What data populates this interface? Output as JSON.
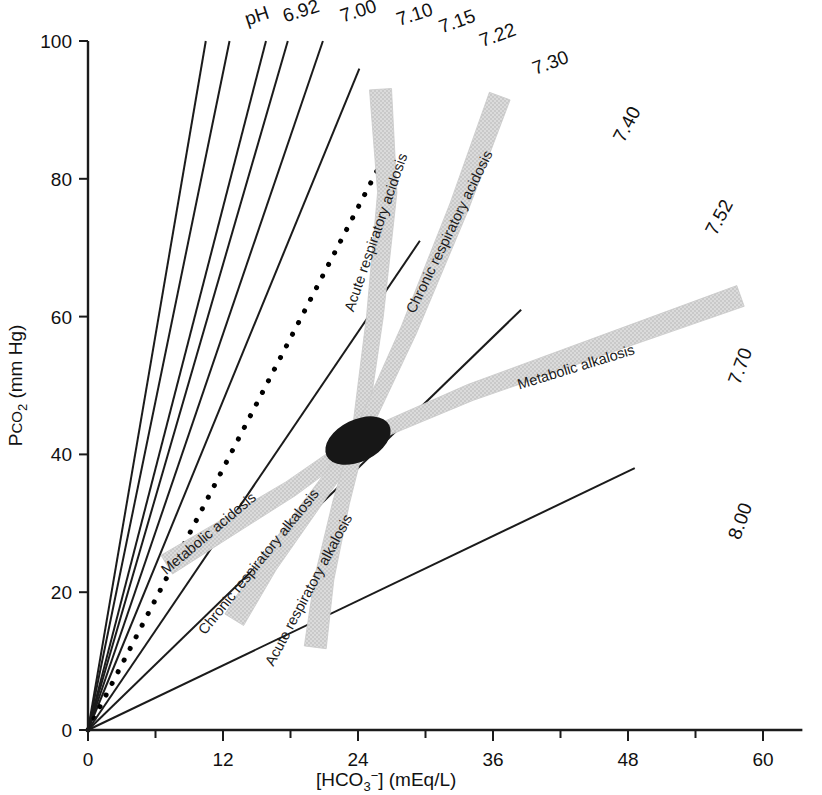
{
  "figure": {
    "background_color": "#ffffff",
    "ink_color": "#1b1b1b",
    "band_color": "#d7d7d7",
    "normal_point_color": "#171717"
  },
  "axes": {
    "x": {
      "label": "[HCO3−] (mEq/L)",
      "label_parts": {
        "prefix": "[HCO",
        "sub": "3",
        "sup": "−",
        "suffix": "] (mEq/L)"
      },
      "ticks": [
        "0",
        "12",
        "24",
        "36",
        "48",
        "60"
      ],
      "tick_values": [
        0,
        12,
        24,
        36,
        48,
        60
      ],
      "minor_tick_values": [
        6,
        18,
        30,
        42,
        54
      ],
      "range": [
        0,
        63
      ]
    },
    "y": {
      "label": "Pco2 (mm Hg)",
      "label_parts": {
        "prefix": "P",
        "small": "CO",
        "sub": "2",
        "suffix": " (mm Hg)"
      },
      "ticks": [
        "0",
        "20",
        "40",
        "60",
        "80",
        "100"
      ],
      "tick_values": [
        0,
        20,
        40,
        60,
        80,
        100
      ],
      "range": [
        0,
        100
      ]
    }
  },
  "ph_axis_prefix": "pH",
  "chart_data": {
    "type": "line",
    "xlabel": "[HCO3-] (mEq/L)",
    "ylabel": "PCO2 (mm Hg)",
    "xlim": [
      0,
      63
    ],
    "ylim": [
      0,
      100
    ],
    "grid": false,
    "legend": "none",
    "note": "Iso-pH rays through the origin; slope = PCO2/[HCO3-]. Shaded bands are 95% confidence regions for single acid-base disturbances.",
    "ph_lines": [
      {
        "label": "6.92",
        "slope": 9.55,
        "style": "solid",
        "end_hco3": 10.47,
        "end_pco2": 100,
        "label_x": 19.1,
        "label_y": 103.5
      },
      {
        "label": "7.00",
        "slope": 7.95,
        "style": "solid",
        "end_hco3": 12.58,
        "end_pco2": 100,
        "label_x": 24.2,
        "label_y": 103.5
      },
      {
        "label": "7.10",
        "slope": 6.32,
        "style": "solid",
        "end_hco3": 15.82,
        "end_pco2": 100,
        "label_x": 29.2,
        "label_y": 103.0
      },
      {
        "label": "7.15",
        "slope": 5.63,
        "style": "solid",
        "end_hco3": 17.76,
        "end_pco2": 100,
        "label_x": 33.0,
        "label_y": 102.0
      },
      {
        "label": "7.22",
        "slope": 4.79,
        "style": "solid",
        "end_hco3": 20.88,
        "end_pco2": 100,
        "label_x": 36.6,
        "label_y": 100.0
      },
      {
        "label": "7.30",
        "slope": 3.98,
        "style": "solid",
        "end_hco3": 24.12,
        "end_pco2": 96,
        "label_x": 41.3,
        "label_y": 96.0
      },
      {
        "label": "7.40",
        "slope": 3.16,
        "style": "dotted",
        "end_hco3": 26.9,
        "end_pco2": 85,
        "label_x": 48.4,
        "label_y": 87.5
      },
      {
        "label": "7.52",
        "slope": 2.4,
        "style": "solid",
        "end_hco3": 29.5,
        "end_pco2": 71,
        "label_x": 56.6,
        "label_y": 74.0
      },
      {
        "label": "7.70",
        "slope": 1.58,
        "style": "solid",
        "end_hco3": 38.5,
        "end_pco2": 61,
        "label_x": 58.5,
        "label_y": 52.5
      },
      {
        "label": "8.00",
        "slope": 0.79,
        "style": "solid",
        "end_hco3": 48.6,
        "end_pco2": 38,
        "label_x": 58.5,
        "label_y": 30.0
      }
    ],
    "bands": [
      {
        "name": "Acute respiratory acidosis",
        "label": "Acute respiratory acidosis",
        "label_hco3": 26.0,
        "label_pco2": 72.0,
        "label_rotation": -71,
        "centerline": [
          [
            24,
            42
          ],
          [
            25.5,
            60
          ],
          [
            26.6,
            78
          ],
          [
            26.0,
            93
          ]
        ]
      },
      {
        "name": "Chronic respiratory acidosis",
        "label": "Chronic respiratory acidosis",
        "label_hco3": 32.5,
        "label_pco2": 72.0,
        "label_rotation": -64,
        "centerline": [
          [
            24,
            42
          ],
          [
            28.5,
            58
          ],
          [
            33.0,
            76
          ],
          [
            36.6,
            92
          ]
        ]
      },
      {
        "name": "Metabolic alkalosis",
        "label": "Metabolic alkalosis",
        "label_hco3": 43.5,
        "label_pco2": 52.0,
        "label_rotation": -17,
        "centerline": [
          [
            24,
            42
          ],
          [
            34,
            49
          ],
          [
            46,
            56
          ],
          [
            58,
            63
          ]
        ]
      },
      {
        "name": "Metabolic acidosis",
        "label": "Metabolic acidosis",
        "label_hco3": 11.0,
        "label_pco2": 28.0,
        "label_rotation": -40,
        "centerline": [
          [
            24,
            42
          ],
          [
            18,
            35
          ],
          [
            12,
            29
          ],
          [
            7,
            24
          ]
        ]
      },
      {
        "name": "Chronic respiratory alkalosis",
        "label": "Chronic respiratory alkalosis",
        "label_hco3": 15.5,
        "label_pco2": 24.0,
        "label_rotation": -51,
        "centerline": [
          [
            24,
            42
          ],
          [
            20,
            33
          ],
          [
            16,
            24
          ],
          [
            13,
            16
          ]
        ]
      },
      {
        "name": "Acute respiratory alkalosis",
        "label": "Acute respiratory alkalosis",
        "label_hco3": 20.0,
        "label_pco2": 20.0,
        "label_rotation": -62,
        "centerline": [
          [
            24,
            42
          ],
          [
            22.5,
            33
          ],
          [
            21,
            22
          ],
          [
            20.2,
            12
          ]
        ]
      }
    ],
    "normal_point": {
      "label": "normal",
      "hco3": 24,
      "pco2": 42,
      "rx": 3.1,
      "ry": 1.6,
      "rotation": -26
    }
  }
}
